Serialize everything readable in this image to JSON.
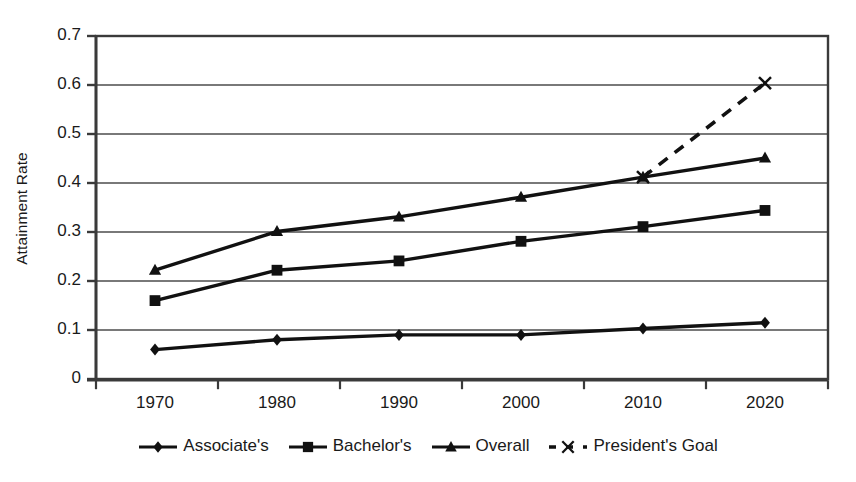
{
  "chart_data": {
    "type": "line",
    "title": "",
    "subtitle": "",
    "xlabel": "",
    "ylabel": "Attainment Rate",
    "x": [
      1970,
      1980,
      1990,
      2000,
      2010,
      2020
    ],
    "categories": [
      "1970",
      "1980",
      "1990",
      "2000",
      "2010",
      "2020"
    ],
    "xtick_labels": [
      "1970",
      "1980",
      "1990",
      "2000",
      "2010",
      "2020"
    ],
    "ytick_labels": [
      "0",
      "0.1",
      "0.2",
      "0.3",
      "0.4",
      "0.5",
      "0.6",
      "0.7"
    ],
    "ytick_values": [
      0,
      0.1,
      0.2,
      0.3,
      0.4,
      0.5,
      0.6,
      0.7
    ],
    "ylim": [
      0,
      0.7
    ],
    "grid": "horizontal",
    "legend_position": "bottom",
    "plot_border": true,
    "series": [
      {
        "name": "Associate's",
        "marker": "diamond",
        "line_style": "solid",
        "color": "#111111",
        "values": [
          0.06,
          0.08,
          0.09,
          0.09,
          0.103,
          0.115
        ]
      },
      {
        "name": "Bachelor's",
        "marker": "square",
        "line_style": "solid",
        "color": "#111111",
        "values": [
          0.16,
          0.222,
          0.241,
          0.281,
          0.311,
          0.344
        ]
      },
      {
        "name": "Overall",
        "marker": "triangle",
        "line_style": "solid",
        "color": "#111111",
        "values": [
          0.222,
          0.301,
          0.331,
          0.371,
          0.412,
          0.451
        ]
      },
      {
        "name": "President's Goal",
        "marker": "x",
        "line_style": "dashed",
        "color": "#111111",
        "values": [
          null,
          null,
          null,
          null,
          0.412,
          0.604
        ]
      }
    ]
  },
  "legend": {
    "items": [
      {
        "label": "Associate's",
        "marker": "diamond",
        "line_style": "solid"
      },
      {
        "label": "Bachelor's",
        "marker": "square",
        "line_style": "solid"
      },
      {
        "label": "Overall",
        "marker": "triangle",
        "line_style": "solid"
      },
      {
        "label": "President's Goal",
        "marker": "x",
        "line_style": "dashed"
      }
    ]
  },
  "axes": {
    "y_title": "Attainment Rate"
  },
  "style": {
    "background": "#ffffff",
    "grid_color": "#4d4d4d",
    "axis_color": "#3a3a3a",
    "series_color": "#111111",
    "text_color": "#1a1a1a"
  }
}
